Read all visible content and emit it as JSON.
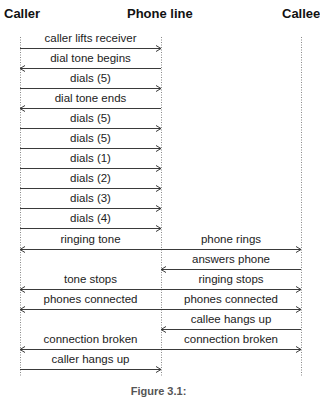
{
  "headers": {
    "caller": "Caller",
    "phone_line": "Phone line",
    "callee": "Callee"
  },
  "lifelines": {
    "caller_x": 20,
    "phone_line_x": 161,
    "callee_x": 301,
    "top_y": 37,
    "bottom_y": 376
  },
  "messages": [
    {
      "y": 48,
      "segments": [
        {
          "label": "caller lifts receiver",
          "from": "caller",
          "to": "phone_line"
        }
      ]
    },
    {
      "y": 68,
      "segments": [
        {
          "label": "dial tone begins",
          "from": "phone_line",
          "to": "caller"
        }
      ]
    },
    {
      "y": 88,
      "segments": [
        {
          "label": "dials (5)",
          "from": "caller",
          "to": "phone_line"
        }
      ]
    },
    {
      "y": 108,
      "segments": [
        {
          "label": "dial tone ends",
          "from": "phone_line",
          "to": "caller"
        }
      ]
    },
    {
      "y": 128,
      "segments": [
        {
          "label": "dials (5)",
          "from": "caller",
          "to": "phone_line"
        }
      ]
    },
    {
      "y": 148,
      "segments": [
        {
          "label": "dials (5)",
          "from": "caller",
          "to": "phone_line"
        }
      ]
    },
    {
      "y": 168,
      "segments": [
        {
          "label": "dials (1)",
          "from": "caller",
          "to": "phone_line"
        }
      ]
    },
    {
      "y": 188,
      "segments": [
        {
          "label": "dials (2)",
          "from": "caller",
          "to": "phone_line"
        }
      ]
    },
    {
      "y": 208,
      "segments": [
        {
          "label": "dials (3)",
          "from": "caller",
          "to": "phone_line"
        }
      ]
    },
    {
      "y": 228,
      "segments": [
        {
          "label": "dials (4)",
          "from": "caller",
          "to": "phone_line"
        }
      ]
    },
    {
      "y": 249,
      "segments": [
        {
          "label": "ringing tone",
          "from": "phone_line",
          "to": "caller"
        },
        {
          "label": "phone rings",
          "from": "phone_line",
          "to": "callee"
        }
      ]
    },
    {
      "y": 269,
      "segments": [
        {
          "label": "answers phone",
          "from": "callee",
          "to": "phone_line"
        }
      ]
    },
    {
      "y": 289,
      "segments": [
        {
          "label": "tone stops",
          "from": "phone_line",
          "to": "caller"
        },
        {
          "label": "ringing stops",
          "from": "phone_line",
          "to": "callee"
        }
      ]
    },
    {
      "y": 309,
      "segments": [
        {
          "label": "phones connected",
          "from": "phone_line",
          "to": "caller"
        },
        {
          "label": "phones connected",
          "from": "phone_line",
          "to": "callee"
        }
      ]
    },
    {
      "y": 329,
      "segments": [
        {
          "label": "callee hangs up",
          "from": "callee",
          "to": "phone_line"
        }
      ]
    },
    {
      "y": 349,
      "segments": [
        {
          "label": "connection broken",
          "from": "phone_line",
          "to": "caller"
        },
        {
          "label": "connection broken",
          "from": "phone_line",
          "to": "callee"
        }
      ]
    },
    {
      "y": 369,
      "segments": [
        {
          "label": "caller hangs up",
          "from": "caller",
          "to": "phone_line"
        }
      ]
    }
  ],
  "caption": "Figure 3.1:",
  "colors": {
    "line": "#3a3a3a",
    "lifeline": "#888888",
    "text": "#222222"
  }
}
